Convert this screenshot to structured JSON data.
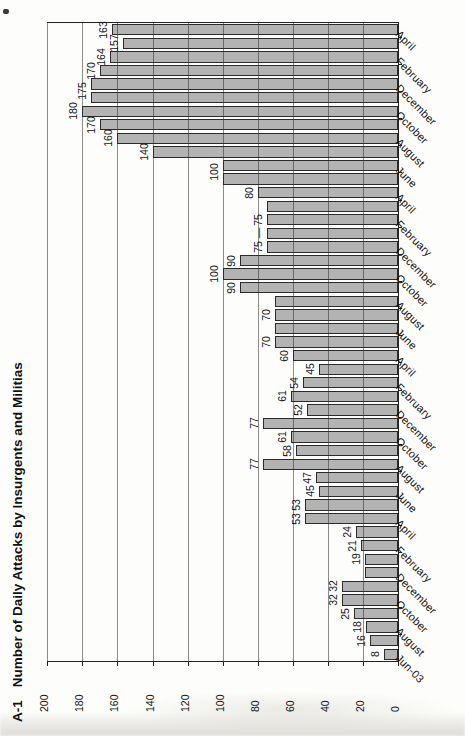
{
  "figure_label": "A-1",
  "title": "Number of Daily Attacks by Insurgents and Militias",
  "chart_data": {
    "type": "bar",
    "orientation": "chart rotated 90deg counterclockwise on page; bars run right-to-left, months bottom-to-top",
    "xlabel": "",
    "ylabel": "",
    "value_axis": {
      "min": 0,
      "max": 200,
      "tick_step": 20,
      "tick_labels": [
        "0",
        "20",
        "40",
        "60",
        "80",
        "100",
        "120",
        "140",
        "160",
        "180",
        "200"
      ]
    },
    "grid": true,
    "categories": [
      "Jun-03",
      "Jul-03",
      "Aug-03",
      "Sep-03",
      "Oct-03",
      "Nov-03",
      "Dec-03",
      "Jan-04",
      "Feb-04",
      "Mar-04",
      "Apr-04",
      "May-04",
      "Jun-04",
      "Jul-04",
      "Aug-04",
      "Sep-04",
      "Oct-04",
      "Nov-04",
      "Dec-04",
      "Jan-05",
      "Feb-05",
      "Mar-05",
      "Apr-05",
      "May-05",
      "Jun-05",
      "Jul-05",
      "Aug-05",
      "Sep-05",
      "Oct-05",
      "Nov-05",
      "Dec-05",
      "Jan-06",
      "Feb-06",
      "Mar-06",
      "Apr-06",
      "May-06",
      "Jun-06",
      "Jul-06",
      "Aug-06",
      "Sep-06",
      "Oct-06",
      "Nov-06",
      "Dec-06",
      "Jan-07",
      "Feb-07",
      "Mar-07",
      "Apr-07"
    ],
    "values": [
      8,
      16,
      18,
      25,
      32,
      32,
      19,
      19,
      21,
      24,
      53,
      53,
      45,
      47,
      77,
      58,
      61,
      77,
      52,
      61,
      54,
      45,
      60,
      70,
      70,
      70,
      70,
      90,
      100,
      90,
      75,
      75,
      75,
      75,
      80,
      100,
      100,
      140,
      160,
      170,
      180,
      175,
      175,
      170,
      164,
      157,
      163
    ],
    "printed_bar_labels": [
      "8",
      "16",
      "18",
      "25",
      "32",
      "32",
      "",
      "19",
      "21",
      "24",
      "53",
      "53",
      "45",
      "47",
      "77",
      "58",
      "61",
      "77",
      "52",
      "61",
      "54",
      "45",
      "60",
      "70",
      "",
      "70",
      "",
      "90",
      "100",
      "90",
      "75",
      "—",
      "75",
      "",
      "80",
      "",
      "",
      "140",
      "160",
      "170",
      "180",
      "",
      "",
      "170",
      "164",
      "157",
      "163"
    ],
    "shared_value_labels": [
      {
        "after_bar_index": 36,
        "text": "100",
        "note": "one label for May-06 and Jun-06 (both 100)"
      },
      {
        "after_bar_index": 42,
        "text": "175",
        "note": "one label for Nov-06 and Dec-06 (both 175)"
      }
    ],
    "category_axis_labels": [
      {
        "bar": 1,
        "text": "Jun-03"
      },
      {
        "bar": 3,
        "text": "August"
      },
      {
        "bar": 5,
        "text": "October"
      },
      {
        "bar": 7,
        "text": "December"
      },
      {
        "bar": 9,
        "text": "February"
      },
      {
        "bar": 11,
        "text": "April"
      },
      {
        "bar": 13,
        "text": "June"
      },
      {
        "bar": 15,
        "text": "August"
      },
      {
        "bar": 17,
        "text": "October"
      },
      {
        "bar": 19,
        "text": "December"
      },
      {
        "bar": 21,
        "text": "February"
      },
      {
        "bar": 23,
        "text": "April"
      },
      {
        "bar": 25,
        "text": "June"
      },
      {
        "bar": 27,
        "text": "August"
      },
      {
        "bar": 29,
        "text": "October"
      },
      {
        "bar": 31,
        "text": "December"
      },
      {
        "bar": 33,
        "text": "February"
      },
      {
        "bar": 35,
        "text": "April"
      },
      {
        "bar": 37,
        "text": "June"
      },
      {
        "bar": 39,
        "text": "August"
      },
      {
        "bar": 41,
        "text": "October"
      },
      {
        "bar": 43,
        "text": "December"
      },
      {
        "bar": 45,
        "text": "February"
      },
      {
        "bar": 47,
        "text": "April"
      }
    ],
    "bar_color": "#b3b3b3",
    "bar_border_color": "#2b2b2b",
    "legend": null
  }
}
